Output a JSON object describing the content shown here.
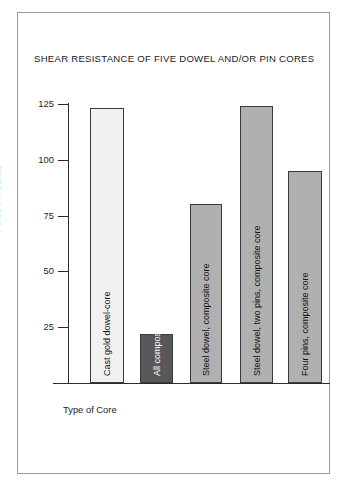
{
  "chart_data": {
    "type": "bar",
    "title": "SHEAR RESISTANCE OF FIVE DOWEL AND/OR PIN CORES",
    "xlabel": "Type of Core",
    "ylabel": "Force in Pounds",
    "categories": [
      "Cast gold dowel-core",
      "All composite dowel-core",
      "Steel dowel, composite core",
      "Steel dowel, two pins, composite core",
      "Four pins, composite core"
    ],
    "values": [
      123,
      22,
      80,
      124,
      95
    ],
    "ylim": [
      0,
      125
    ],
    "yticks": [
      25,
      50,
      75,
      100,
      125
    ],
    "ytick_labels": [
      "25",
      "50",
      "75",
      "100",
      "125"
    ],
    "grid": false,
    "legend": "none",
    "bar_colors": [
      "#f1f1f1",
      "#585858",
      "#b0b0b0",
      "#b0b0b0",
      "#b0b0b0"
    ],
    "bar_edge_color": "#3a3a3a"
  },
  "colors": {
    "frame_border": "#9a9a9a",
    "axis": "#2b2b2b",
    "text": "#1c1c1c",
    "background": "#ffffff"
  }
}
